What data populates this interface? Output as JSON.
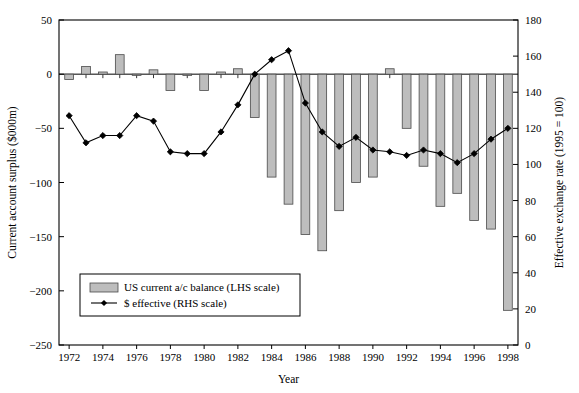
{
  "chart_data": {
    "type": "bar",
    "title": "",
    "xlabel": "Year",
    "ylabel": "Current account surplus ($000m)",
    "y2label": "Effective exchange rate (1995 = 100)",
    "grid": false,
    "legend_position": "bottom-left-inside",
    "xlim": [
      1971.4,
      1998.6
    ],
    "ylim": [
      -250,
      50
    ],
    "y2lim": [
      0,
      180
    ],
    "x": [
      1972,
      1973,
      1974,
      1975,
      1976,
      1977,
      1978,
      1979,
      1980,
      1981,
      1982,
      1983,
      1984,
      1985,
      1986,
      1987,
      1988,
      1989,
      1990,
      1991,
      1992,
      1993,
      1994,
      1995,
      1996,
      1997,
      1998
    ],
    "categories": [
      "1972",
      "1973",
      "1974",
      "1975",
      "1976",
      "1977",
      "1978",
      "1979",
      "1980",
      "1981",
      "1982",
      "1983",
      "1984",
      "1985",
      "1986",
      "1987",
      "1988",
      "1989",
      "1990",
      "1991",
      "1992",
      "1993",
      "1994",
      "1995",
      "1996",
      "1997",
      "1998"
    ],
    "xticks": [
      1972,
      1974,
      1976,
      1978,
      1980,
      1982,
      1984,
      1986,
      1988,
      1990,
      1992,
      1994,
      1996,
      1998
    ],
    "xticklabels": [
      "1972",
      "1974",
      "1976",
      "1978",
      "1980",
      "1982",
      "1984",
      "1986",
      "1988",
      "1990",
      "1992",
      "1994",
      "1996",
      "1998"
    ],
    "yticks": [
      50,
      0,
      -50,
      -100,
      -150,
      -200,
      -250
    ],
    "yticklabels": [
      "50",
      "0",
      "−50",
      "−100",
      "−150",
      "−200",
      "−250"
    ],
    "y2ticks": [
      180,
      160,
      140,
      120,
      100,
      80,
      60,
      40,
      20,
      0
    ],
    "y2ticklabels": [
      "180",
      "160",
      "140",
      "120",
      "100",
      "80",
      "60",
      "40",
      "20",
      "0"
    ],
    "series": [
      {
        "name": "US current a/c balance (LHS scale)",
        "type": "bar",
        "axis": "left",
        "color": "#bdbdbd",
        "edge": "#4a4a4a",
        "values": [
          -5,
          7,
          2,
          18,
          0,
          4,
          -15,
          -1,
          -15,
          2,
          5,
          -40,
          -95,
          -120,
          -148,
          -163,
          -126,
          -100,
          -95,
          5,
          -50,
          -85,
          -122,
          -110,
          -135,
          -143,
          -218
        ]
      },
      {
        "name": "$ effective (RHS scale)",
        "type": "line",
        "axis": "right",
        "color": "#000000",
        "marker": "diamond",
        "values": [
          127,
          112,
          116,
          116,
          127,
          124,
          107,
          106,
          106,
          118,
          133,
          150,
          158,
          163,
          134,
          118,
          110,
          115,
          108,
          107,
          105,
          108,
          106,
          101,
          106,
          114,
          120
        ]
      }
    ],
    "legend": [
      {
        "label": "US current a/c balance (LHS scale)",
        "marker": "swatch"
      },
      {
        "label": "$ effective (RHS scale)",
        "marker": "line-diamond"
      }
    ]
  },
  "colors": {
    "bar_fill": "#bdbdbd",
    "bar_edge": "#4a4a4a",
    "line": "#000000",
    "axis": "#000000",
    "background": "#ffffff"
  }
}
